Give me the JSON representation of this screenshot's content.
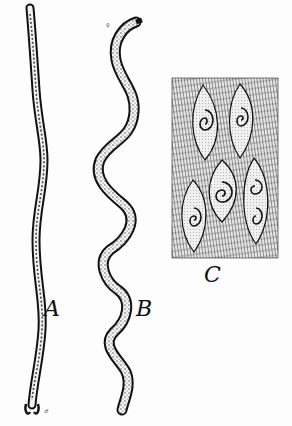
{
  "figure": {
    "panels": [
      {
        "id": "A",
        "label": "A",
        "description": "long slender worm, straight with slight waves, hooked tail end"
      },
      {
        "id": "B",
        "label": "B",
        "description": "sinuous worm with dotted interior, curving S-shapes"
      },
      {
        "id": "C",
        "label": "C",
        "description": "muscle tissue section with encysted coiled larvae in lemon-shaped cysts"
      }
    ],
    "annotations": {
      "a_tail_mark": "♂",
      "b_head_mark": "♀",
      "c_corner_mark": "L"
    },
    "colors": {
      "ink": "#111111",
      "paper": "#fdfdfd",
      "stipple": "#555555"
    }
  }
}
